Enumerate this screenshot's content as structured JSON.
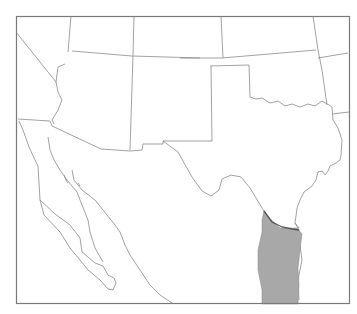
{
  "map": {
    "type": "range-map",
    "region": "Southwestern United States and northern Mexico",
    "colors": {
      "background": "#ffffff",
      "borders": "#8a8a8a",
      "range_fill": "#a8a8a8"
    },
    "regions_depicted": [
      "California",
      "Nevada",
      "Utah",
      "Colorado",
      "Kansas",
      "Missouri",
      "Arizona",
      "New Mexico",
      "Oklahoma",
      "Arkansas",
      "Texas",
      "Louisiana",
      "Baja California",
      "Mexico"
    ],
    "legend": [],
    "labels": [],
    "highlighted_range": "South Texas / northeastern Mexico (Rio Grande region)"
  }
}
